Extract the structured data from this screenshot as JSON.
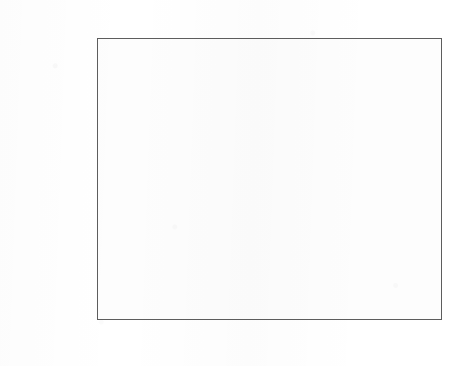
{
  "chart_data": {
    "type": "bar",
    "orientation": "horizontal",
    "xlabel": "Importance",
    "ylabel": "",
    "secondary_xlabel": "Normalized Importance",
    "categories": [
      "GDP_GrowthRate",
      "GDP",
      "LifeExpectancyAtBirth",
      "InfantMortality",
      "HealthyLifeYears"
    ],
    "values": [
      0.345,
      0.325,
      0.138,
      0.125,
      0.053
    ],
    "normalized_values": [
      100,
      94.2,
      40.0,
      36.2,
      15.4
    ],
    "xlim": [
      0.0,
      0.3772
    ],
    "normalized_xlim": [
      0,
      109.8
    ],
    "bottom_ticks": [
      "0,0",
      "0,1",
      "0,2",
      "0,3"
    ],
    "bottom_tick_values": [
      0.0,
      0.1,
      0.2,
      0.3
    ],
    "top_ticks": [
      "0%",
      "20%",
      "40%",
      "60%",
      "80%",
      "100%"
    ],
    "top_tick_values": [
      0,
      20,
      40,
      60,
      80,
      100
    ],
    "grid": false,
    "legend": null,
    "bar_color": "#c9c9c9",
    "bar_border_color": "#4f4f4f",
    "frame_color": "#5d5d5d",
    "background_color": "#ffffff"
  }
}
